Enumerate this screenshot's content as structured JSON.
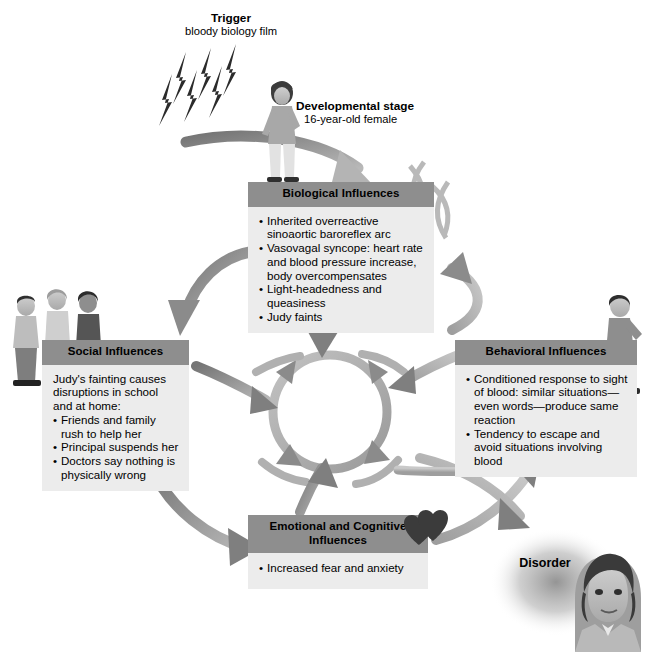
{
  "diagram": {
    "type": "cycle-diagram",
    "colors": {
      "header_bar": "#8e8e8e",
      "box_body": "#ececec",
      "arrow": "#8a8a8a",
      "arrow_dark": "#6e6e6e",
      "text": "#000000",
      "heart": "#3a3a3a"
    }
  },
  "labels": {
    "trigger": {
      "title": "Trigger",
      "subtitle": "bloody biology film"
    },
    "developmental": {
      "title": "Developmental stage",
      "subtitle": "16-year-old female"
    },
    "disorder": {
      "title": "Disorder"
    }
  },
  "boxes": {
    "biological": {
      "header": "Biological Influences",
      "items": [
        "Inherited overreactive sinoaortic baroreflex arc",
        "Vasovagal syncope: heart rate and blood pressure increase, body overcompensates",
        "Light-headedness and queasiness",
        "Judy faints"
      ]
    },
    "social": {
      "header": "Social Influences",
      "intro": "Judy's fainting causes disruptions in school and at home:",
      "items": [
        "Friends and family rush to help her",
        "Principal suspends her",
        "Doctors say nothing is physically wrong"
      ]
    },
    "behavioral": {
      "header": "Behavioral Influences",
      "items": [
        "Conditioned response to sight of blood: similar situations—even words—produce same reaction",
        "Tendency to escape and avoid situations involving blood"
      ]
    },
    "emotional": {
      "header": "Emotional and Cognitive Influences",
      "items": [
        "Increased fear and anxiety"
      ]
    }
  },
  "icons": {
    "lightning": "lightning-bolt-icon",
    "chromosome": "chromosome-icon",
    "heart": "heart-icon",
    "teen_girl": "standing-teen-girl-figure",
    "people_group": "three-people-figures",
    "running_girl": "running-girl-figure",
    "portrait": "woman-portrait-figure"
  }
}
